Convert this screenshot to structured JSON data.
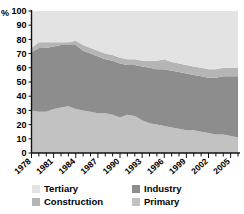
{
  "chart_data": {
    "type": "area",
    "stacked": true,
    "title": "",
    "xlabel": "",
    "ylabel": "%",
    "ylim": [
      0,
      100
    ],
    "ytick_step": 10,
    "yticks": [
      0,
      10,
      20,
      30,
      40,
      50,
      60,
      70,
      80,
      90,
      100
    ],
    "grid": false,
    "legend_position": "bottom",
    "x": [
      1978,
      1979,
      1980,
      1981,
      1982,
      1983,
      1984,
      1985,
      1986,
      1987,
      1988,
      1989,
      1990,
      1991,
      1992,
      1993,
      1994,
      1995,
      1996,
      1997,
      1998,
      1999,
      2000,
      2001,
      2002,
      2003,
      2004,
      2005,
      2006
    ],
    "xtick_labels": [
      "1978",
      "1981",
      "1984",
      "1987",
      "1990",
      "1993",
      "1996",
      "1999",
      "2002",
      "2005"
    ],
    "xtick_values": [
      1978,
      1981,
      1984,
      1987,
      1990,
      1993,
      1996,
      1999,
      2002,
      2005
    ],
    "series": [
      {
        "name": "Primary",
        "color": "#c2c2c2",
        "values": [
          30,
          29,
          29,
          31,
          32,
          33,
          31,
          30,
          29,
          28,
          28,
          27,
          25,
          27,
          26,
          23,
          21,
          20,
          19,
          18,
          17,
          16,
          16,
          15,
          14,
          13,
          13,
          12,
          11
        ]
      },
      {
        "name": "Industry",
        "color": "#8d8d8d",
        "values": [
          41,
          45,
          45,
          44,
          44,
          43,
          45,
          42,
          41,
          40,
          38,
          38,
          38,
          35,
          36,
          38,
          39,
          39,
          40,
          40,
          40,
          40,
          39,
          39,
          39,
          40,
          41,
          42,
          43
        ]
      },
      {
        "name": "Construction",
        "color": "#b5b5b5",
        "values": [
          3,
          4,
          4,
          3,
          2,
          2,
          3,
          4,
          4,
          4,
          4,
          4,
          4,
          4,
          4,
          4,
          5,
          6,
          7,
          6,
          6,
          6,
          6,
          6,
          6,
          6,
          6,
          6,
          6
        ]
      },
      {
        "name": "Tertiary",
        "color": "#e3e3e3",
        "values": [
          26,
          22,
          22,
          22,
          22,
          22,
          21,
          24,
          26,
          28,
          30,
          31,
          33,
          34,
          34,
          35,
          35,
          35,
          34,
          36,
          37,
          38,
          39,
          40,
          41,
          41,
          40,
          40,
          40
        ]
      }
    ]
  },
  "axes": {
    "y_unit_label": "%"
  },
  "legend": {
    "items": [
      {
        "label": "Tertiary",
        "color": "#e3e3e3"
      },
      {
        "label": "Industry",
        "color": "#8d8d8d"
      },
      {
        "label": "Construction",
        "color": "#b5b5b5"
      },
      {
        "label": "Primary",
        "color": "#c2c2c2"
      }
    ]
  }
}
